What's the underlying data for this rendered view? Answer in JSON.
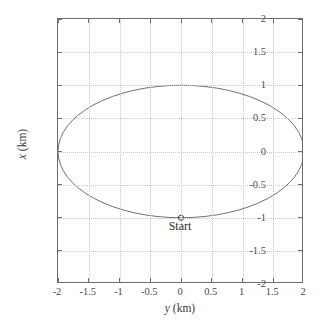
{
  "chart_data": {
    "type": "line",
    "title": "",
    "xlabel": "y (km)",
    "ylabel": "x (km)",
    "xlabel_var": "y",
    "xlabel_unit": " (km)",
    "ylabel_var": "x",
    "ylabel_unit": " (km)",
    "xlim": [
      -2,
      2
    ],
    "ylim": [
      -2,
      2
    ],
    "xticks": [
      -2,
      -1.5,
      -1,
      -0.5,
      0,
      0.5,
      1,
      1.5,
      2
    ],
    "yticks": [
      -2,
      -1.5,
      -1,
      -0.5,
      0,
      0.5,
      1,
      1.5,
      2
    ],
    "xtick_labels": [
      "-2",
      "-1.5",
      "-1",
      "-0.5",
      "0",
      "0.5",
      "1",
      "1.5",
      "2"
    ],
    "ytick_labels": [
      "-2",
      "-1.5",
      "-1",
      "-0.5",
      "0",
      "0.5",
      "1",
      "1.5",
      "2"
    ],
    "grid": true,
    "grid_style": "dotted",
    "grid_color": "#c8c8c8",
    "axis_color": "#6e6e6e",
    "legend": null,
    "series": [
      {
        "name": "trajectory",
        "kind": "closed-ellipse",
        "color": "#707070",
        "line_width": 1,
        "center": [
          0,
          0
        ],
        "semi_axis_x": 2,
        "semi_axis_y": 1,
        "description": "Closed elliptical relative-motion orbit, 2 km along y, 1 km along x"
      }
    ],
    "annotations": [
      {
        "name": "start-marker",
        "label": "Start",
        "marker": "circle-open",
        "x": 0,
        "y": -1,
        "label_offset": [
          0,
          -0.09
        ],
        "label_position": "below"
      }
    ]
  }
}
